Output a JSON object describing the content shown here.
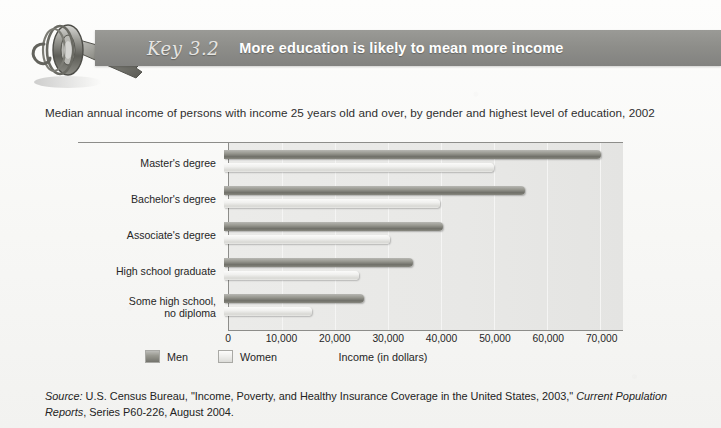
{
  "header": {
    "key_label": "Key 3.2",
    "title": "More education is likely to mean more income"
  },
  "subtitle": "Median annual income of persons with income 25 years old and over, by gender and highest level of education, 2002",
  "legend": {
    "men_label": "Men",
    "women_label": "Women"
  },
  "axis": {
    "x_title": "Income (in dollars)"
  },
  "source": {
    "label": "Source:",
    "line1_rest": " U.S. Census Bureau, \"Income, Poverty, and Healthy Insurance Coverage in the United States, 2003,\" ",
    "line1_italic": "Current",
    "line2_italic": "Population Reports",
    "line2_rest": ", Series P60-226, August 2004."
  },
  "colors": {
    "banner": "#8e8e8a",
    "men_bar": "#85857e",
    "women_bar": "#eeeeec",
    "plot_background": "#e8e8e6",
    "axis_line": "#8d8d8a"
  },
  "chart_data": {
    "type": "bar",
    "orientation": "horizontal",
    "title": "More education is likely to mean more income",
    "subtitle": "Median annual income of persons with income 25 years old and over, by gender and highest level of education, 2002",
    "categories": [
      "Master's degree",
      "Bachelor's degree",
      "Associate's degree",
      "High school graduate",
      "Some high school,\nno diploma"
    ],
    "series": [
      {
        "name": "Men",
        "values": [
          70640,
          56334,
          41110,
          35412,
          26277
        ]
      },
      {
        "name": "Women",
        "values": [
          50670,
          40415,
          31040,
          25303,
          16500
        ]
      }
    ],
    "xlabel": "Income (in dollars)",
    "ylabel": "",
    "xlim": [
      0,
      74000
    ],
    "xticks": [
      0,
      10000,
      20000,
      30000,
      40000,
      50000,
      60000,
      70000
    ],
    "xtick_labels": [
      "0",
      "10,000",
      "20,000",
      "30,000",
      "40,000",
      "50,000",
      "60,000",
      "70,000"
    ],
    "grid": true,
    "grid_axis": "x",
    "legend_position": "bottom-left"
  }
}
